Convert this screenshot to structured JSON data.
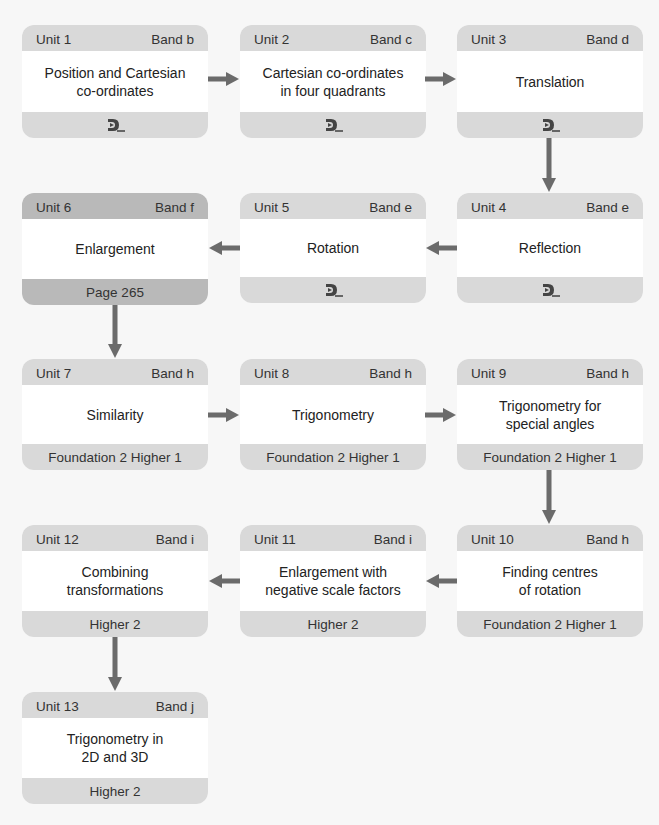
{
  "colors": {
    "background": "#f7f7f7",
    "box_band": "#d9d9d9",
    "current_band": "#b9b9b9",
    "box_body": "#ffffff",
    "arrow": "#6b6b6b"
  },
  "units": [
    {
      "unit": "Unit 1",
      "band": "Band b",
      "title": "Position and Cartesian\nco-ordinates",
      "footer_icon": "dl-logo-icon"
    },
    {
      "unit": "Unit 2",
      "band": "Band c",
      "title": "Cartesian co-ordinates\nin four quadrants",
      "footer_icon": "dl-logo-icon"
    },
    {
      "unit": "Unit 3",
      "band": "Band d",
      "title": "Translation",
      "footer_icon": "dl-logo-icon"
    },
    {
      "unit": "Unit 4",
      "band": "Band e",
      "title": "Reflection",
      "footer_icon": "dl-logo-icon"
    },
    {
      "unit": "Unit 5",
      "band": "Band e",
      "title": "Rotation",
      "footer_icon": "dl-logo-icon"
    },
    {
      "unit": "Unit 6",
      "band": "Band f",
      "title": "Enlargement",
      "footer": "Page 265",
      "current": true
    },
    {
      "unit": "Unit 7",
      "band": "Band h",
      "title": "Similarity",
      "footer": "Foundation 2 Higher 1"
    },
    {
      "unit": "Unit 8",
      "band": "Band h",
      "title": "Trigonometry",
      "footer": "Foundation 2 Higher 1"
    },
    {
      "unit": "Unit 9",
      "band": "Band h",
      "title": "Trigonometry for\nspecial angles",
      "footer": "Foundation 2 Higher 1"
    },
    {
      "unit": "Unit 10",
      "band": "Band h",
      "title": "Finding centres\nof rotation",
      "footer": "Foundation 2 Higher 1"
    },
    {
      "unit": "Unit 11",
      "band": "Band i",
      "title": "Enlargement with\nnegative scale factors",
      "footer": "Higher 2"
    },
    {
      "unit": "Unit 12",
      "band": "Band i",
      "title": "Combining\ntransformations",
      "footer": "Higher 2"
    },
    {
      "unit": "Unit 13",
      "band": "Band j",
      "title": "Trigonometry in\n2D and 3D",
      "footer": "Higher 2"
    }
  ]
}
